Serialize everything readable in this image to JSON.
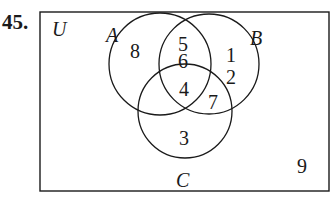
{
  "problem_number": "45.",
  "universe_label": "U",
  "sets": [
    {
      "label": "A"
    },
    {
      "label": "B"
    },
    {
      "label": "C"
    }
  ],
  "regions": {
    "A_only": "8",
    "A_and_B_only_top": "5",
    "A_and_B_only_bottom": "6",
    "B_only_top": "1",
    "B_only_bottom": "2",
    "A_B_C": "4",
    "B_and_C_only": "7",
    "C_only": "3",
    "outside": "9"
  }
}
